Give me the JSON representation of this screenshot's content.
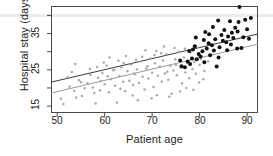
{
  "chart_data": {
    "type": "scatter",
    "title": "",
    "xlabel": "Patient age",
    "ylabel": "Hospital stay (days)",
    "xlim": [
      48.7,
      92.3
    ],
    "ylim": [
      13.1,
      42.6
    ],
    "xticks": [
      50,
      60,
      70,
      80,
      90
    ],
    "yticks": [
      15,
      25,
      35
    ],
    "minor_yticks": [
      20,
      30,
      40
    ],
    "grid": false,
    "legend": null,
    "series": [
      {
        "name": "gray-group",
        "color": "#aaaaaa",
        "marker": "circle-open",
        "points": [
          [
            50.8,
            17.0
          ],
          [
            51.3,
            15.6
          ],
          [
            52.2,
            23.0
          ],
          [
            52.6,
            20.4
          ],
          [
            53.1,
            24.4
          ],
          [
            53.6,
            19.2
          ],
          [
            54.0,
            17.4
          ],
          [
            54.6,
            22.1
          ],
          [
            55.2,
            17.8
          ],
          [
            55.8,
            19.9
          ],
          [
            56.4,
            21.3
          ],
          [
            57.0,
            23.6
          ],
          [
            57.5,
            20.1
          ],
          [
            58.1,
            15.7
          ],
          [
            58.6,
            22.8
          ],
          [
            59.0,
            19.4
          ],
          [
            59.5,
            24.1
          ],
          [
            60.0,
            21.0
          ],
          [
            60.4,
            26.2
          ],
          [
            60.9,
            18.8
          ],
          [
            61.3,
            22.4
          ],
          [
            61.8,
            24.9
          ],
          [
            62.2,
            20.6
          ],
          [
            62.6,
            16.0
          ],
          [
            63.1,
            23.3
          ],
          [
            63.5,
            25.7
          ],
          [
            63.9,
            21.7
          ],
          [
            64.3,
            19.1
          ],
          [
            64.8,
            24.6
          ],
          [
            65.2,
            22.0
          ],
          [
            65.6,
            26.5
          ],
          [
            66.0,
            20.8
          ],
          [
            66.4,
            23.8
          ],
          [
            66.8,
            25.1
          ],
          [
            67.2,
            21.4
          ],
          [
            67.6,
            27.3
          ],
          [
            68.0,
            23.1
          ],
          [
            68.4,
            19.6
          ],
          [
            68.8,
            25.4
          ],
          [
            69.2,
            22.6
          ],
          [
            69.6,
            28.1
          ],
          [
            70.0,
            24.2
          ],
          [
            70.3,
            20.3
          ],
          [
            70.6,
            26.8
          ],
          [
            70.9,
            30.2
          ],
          [
            71.2,
            23.4
          ],
          [
            71.6,
            25.9
          ],
          [
            72.0,
            21.8
          ],
          [
            72.3,
            27.6
          ],
          [
            72.7,
            24.0
          ],
          [
            73.0,
            29.3
          ],
          [
            73.4,
            22.3
          ],
          [
            73.8,
            26.1
          ],
          [
            74.1,
            18.4
          ],
          [
            74.5,
            24.8
          ],
          [
            74.9,
            27.9
          ],
          [
            75.2,
            23.5
          ],
          [
            75.6,
            30.0
          ],
          [
            76.0,
            25.6
          ],
          [
            76.3,
            21.2
          ],
          [
            76.7,
            28.4
          ],
          [
            77.0,
            24.3
          ],
          [
            77.4,
            26.9
          ],
          [
            77.8,
            22.7
          ],
          [
            78.1,
            29.8
          ],
          [
            78.5,
            25.2
          ],
          [
            78.9,
            27.2
          ],
          [
            79.2,
            23.9
          ],
          [
            79.6,
            31.1
          ],
          [
            80.0,
            26.4
          ],
          [
            53.8,
            26.6
          ],
          [
            56.9,
            25.3
          ],
          [
            59.8,
            27.0
          ],
          [
            61.0,
            28.4
          ],
          [
            62.9,
            27.5
          ],
          [
            64.5,
            28.8
          ],
          [
            65.9,
            17.9
          ],
          [
            67.0,
            16.6
          ],
          [
            68.6,
            30.4
          ],
          [
            69.9,
            17.2
          ],
          [
            71.0,
            18.0
          ],
          [
            72.5,
            31.4
          ],
          [
            73.6,
            17.6
          ],
          [
            74.7,
            31.0
          ],
          [
            75.9,
            19.0
          ],
          [
            77.2,
            20.0
          ],
          [
            78.7,
            19.5
          ],
          [
            79.9,
            21.5
          ],
          [
            66.6,
            27.8
          ],
          [
            70.5,
            29.0
          ],
          [
            63.3,
            19.8
          ],
          [
            60.6,
            23.2
          ],
          [
            58.4,
            25.8
          ],
          [
            57.8,
            18.6
          ],
          [
            55.0,
            21.6
          ],
          [
            69.0,
            26.0
          ],
          [
            71.9,
            29.6
          ],
          [
            73.2,
            24.5
          ],
          [
            75.0,
            26.3
          ],
          [
            76.9,
            30.8
          ],
          [
            67.9,
            28.6
          ],
          [
            66.2,
            24.0
          ],
          [
            64.0,
            26.9
          ],
          [
            62.0,
            25.0
          ],
          [
            59.2,
            21.9
          ],
          [
            80.3,
            28.0
          ],
          [
            81.0,
            24.7
          ],
          [
            81.8,
            27.4
          ],
          [
            82.4,
            29.1
          ],
          [
            80.8,
            22.4
          ]
        ]
      },
      {
        "name": "black-group",
        "color": "#111111",
        "marker": "circle-filled",
        "points": [
          [
            76.2,
            26.0
          ],
          [
            76.9,
            25.7
          ],
          [
            77.5,
            27.3
          ],
          [
            78.0,
            26.6
          ],
          [
            78.4,
            28.1
          ],
          [
            78.6,
            30.6
          ],
          [
            79.0,
            31.5
          ],
          [
            79.4,
            27.9
          ],
          [
            79.8,
            29.4
          ],
          [
            80.2,
            28.7
          ],
          [
            80.6,
            30.1
          ],
          [
            81.0,
            27.1
          ],
          [
            81.5,
            30.9
          ],
          [
            81.9,
            32.3
          ],
          [
            82.2,
            29.0
          ],
          [
            82.6,
            31.8
          ],
          [
            83.0,
            30.3
          ],
          [
            83.3,
            33.4
          ],
          [
            83.6,
            25.9
          ],
          [
            83.9,
            38.6
          ],
          [
            84.2,
            31.2
          ],
          [
            84.6,
            34.6
          ],
          [
            84.9,
            33.0
          ],
          [
            85.2,
            36.0
          ],
          [
            85.6,
            32.6
          ],
          [
            86.0,
            34.2
          ],
          [
            86.4,
            38.4
          ],
          [
            86.8,
            35.2
          ],
          [
            87.1,
            33.8
          ],
          [
            87.5,
            36.6
          ],
          [
            87.9,
            30.9
          ],
          [
            88.2,
            38.2
          ],
          [
            88.4,
            42.3
          ],
          [
            88.8,
            31.0
          ],
          [
            89.2,
            34.0
          ],
          [
            89.6,
            38.8
          ],
          [
            90.0,
            36.2
          ],
          [
            90.4,
            33.6
          ],
          [
            90.8,
            39.3
          ],
          [
            82.0,
            34.8
          ],
          [
            80.9,
            33.2
          ],
          [
            79.2,
            33.9
          ],
          [
            77.8,
            30.2
          ],
          [
            84.0,
            28.4
          ],
          [
            85.8,
            30.4
          ],
          [
            86.6,
            32.0
          ],
          [
            88.0,
            35.6
          ],
          [
            82.8,
            36.8
          ],
          [
            75.9,
            27.6
          ],
          [
            81.2,
            35.4
          ]
        ]
      }
    ],
    "fit_lines": [
      {
        "name": "dark-regression-line",
        "color": "#3a3a3a",
        "x0": 48.7,
        "y0": 21.6,
        "x1": 92.3,
        "y1": 34.9
      },
      {
        "name": "gray-regression-line",
        "color": "#9b9b9b",
        "x0": 48.7,
        "y0": 18.6,
        "x1": 92.3,
        "y1": 32.1
      }
    ]
  },
  "axes": {
    "ylabel": "Hospital stay (days)",
    "xlabel": "Patient age",
    "ytick_labels": [
      "35",
      "25",
      "15"
    ],
    "xtick_labels": [
      "50",
      "60",
      "70",
      "80",
      "90"
    ]
  }
}
